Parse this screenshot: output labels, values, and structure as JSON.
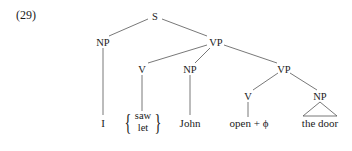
{
  "example": {
    "number": "(29)"
  },
  "tree": {
    "nodes": {
      "s": "S",
      "np_subj": "NP",
      "vp_top": "VP",
      "v_main": "V",
      "np_obj": "NP",
      "vp_lower": "VP",
      "v_lower": "V",
      "np_lower": "NP"
    },
    "leaves": {
      "subject": "I",
      "verb_options": [
        "saw",
        "let"
      ],
      "object": "John",
      "lower_verb": "open + ϕ",
      "lower_object": "the door"
    }
  }
}
